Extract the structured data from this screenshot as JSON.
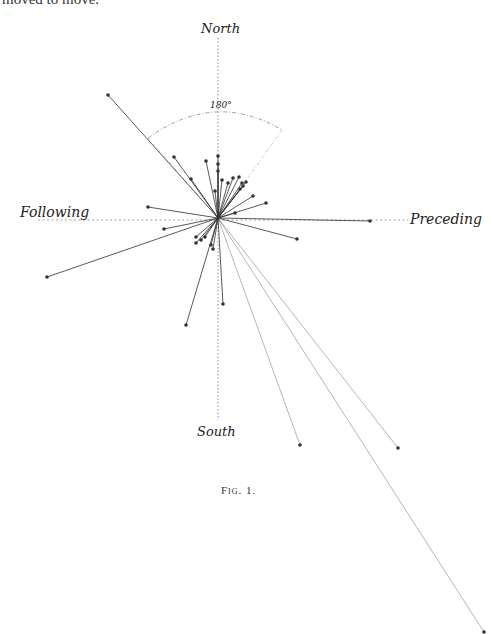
{
  "page": {
    "clipped_text": "moved to move."
  },
  "diagram": {
    "labels": {
      "north": "North",
      "south": "South",
      "following": "Following",
      "preceding": "Preceding",
      "arc_angle": "180°"
    },
    "caption": "Fig. 1.",
    "center": [
      218,
      218
    ],
    "axis_color": "#888888",
    "vector_color": "#333333",
    "vectors": [
      {
        "end": [
          108,
          95
        ]
      },
      {
        "end": [
          47,
          277
        ]
      },
      {
        "end": [
          148,
          207
        ]
      },
      {
        "end": [
          164,
          229
        ]
      },
      {
        "end": [
          174,
          157
        ]
      },
      {
        "end": [
          191,
          179
        ]
      },
      {
        "end": [
          206,
          161
        ]
      },
      {
        "end": [
          218,
          156
        ]
      },
      {
        "end": [
          218,
          164
        ]
      },
      {
        "end": [
          218,
          171
        ]
      },
      {
        "end": [
          222,
          180
        ]
      },
      {
        "end": [
          215,
          191
        ]
      },
      {
        "end": [
          228,
          183
        ]
      },
      {
        "end": [
          233,
          178
        ]
      },
      {
        "end": [
          239,
          177
        ]
      },
      {
        "end": [
          242,
          183
        ]
      },
      {
        "end": [
          240,
          189
        ]
      },
      {
        "end": [
          243,
          186
        ]
      },
      {
        "end": [
          246,
          182
        ]
      },
      {
        "end": [
          253,
          196
        ]
      },
      {
        "end": [
          266,
          203
        ]
      },
      {
        "end": [
          235,
          213
        ]
      },
      {
        "end": [
          297,
          239
        ]
      },
      {
        "end": [
          370,
          221
        ]
      },
      {
        "end": [
          196,
          237
        ]
      },
      {
        "end": [
          201,
          240
        ]
      },
      {
        "end": [
          205,
          237
        ]
      },
      {
        "end": [
          196,
          243
        ]
      },
      {
        "end": [
          211,
          245
        ]
      },
      {
        "end": [
          213,
          249
        ]
      },
      {
        "end": [
          186,
          325
        ]
      },
      {
        "end": [
          223,
          304
        ]
      },
      {
        "end": [
          300,
          445
        ]
      },
      {
        "end": [
          398,
          448
        ]
      },
      {
        "end": [
          484,
          632
        ]
      }
    ]
  }
}
